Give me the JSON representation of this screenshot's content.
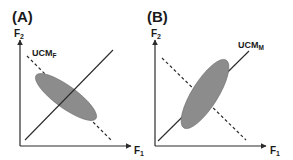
{
  "figure": {
    "colors": {
      "axis": "#2a2a2a",
      "ellipse_fill": "#8c8c8c",
      "ellipse_stroke": "#6e6e6e",
      "line": "#2a2a2a"
    },
    "panels": [
      {
        "id": "A",
        "label": "(A)",
        "y_axis": {
          "label": "F",
          "sub": "2"
        },
        "x_axis": {
          "label": "F",
          "sub": "1"
        },
        "ucm": {
          "label": "UCM",
          "sub": "F"
        },
        "description": "Variance ellipse elongated along dashed line (perpendicular to solid line)"
      },
      {
        "id": "B",
        "label": "(B)",
        "y_axis": {
          "label": "F",
          "sub": "2"
        },
        "x_axis": {
          "label": "F",
          "sub": "1"
        },
        "ucm": {
          "label": "UCM",
          "sub": "M"
        },
        "description": "Variance ellipse elongated along solid line (UCM)"
      }
    ]
  }
}
